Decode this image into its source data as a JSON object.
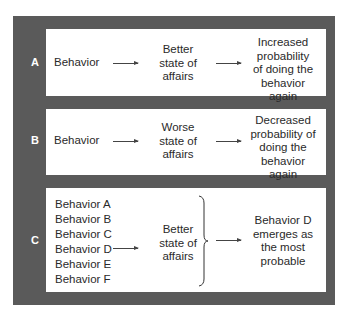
{
  "rows": [
    {
      "label": "A",
      "behavior": "Behavior",
      "consequence": [
        "Better",
        "state of",
        "affairs"
      ],
      "result": [
        "Increased",
        "probability",
        "of doing the",
        "behavior again"
      ]
    },
    {
      "label": "B",
      "behavior": "Behavior",
      "consequence": [
        "Worse",
        "state of",
        "affairs"
      ],
      "result": [
        "Decreased",
        "probability of",
        "doing the",
        "behavior again"
      ]
    },
    {
      "label": "C",
      "behaviors": [
        "Behavior A",
        "Behavior B",
        "Behavior C",
        "Behavior D",
        "Behavior E",
        "Behavior F"
      ],
      "consequence": [
        "Better",
        "state of",
        "affairs"
      ],
      "result": [
        "Behavior D",
        "emerges as",
        "the most",
        "probable"
      ]
    }
  ],
  "colors": {
    "panel": "#5a5a5a",
    "box": "#ffffff",
    "text": "#2a2a2a",
    "letter": "#ffffff"
  }
}
